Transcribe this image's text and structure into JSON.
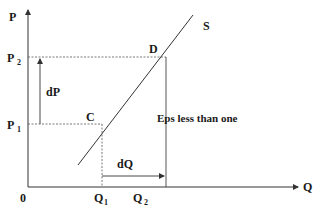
{
  "diagram": {
    "axes": {
      "y_label": "P",
      "x_label": "Q",
      "origin_label": "0"
    },
    "curve": {
      "label": "S"
    },
    "points": {
      "upper": {
        "label": "D"
      },
      "lower": {
        "label": "C"
      }
    },
    "price_levels": {
      "p1": {
        "main": "P",
        "sub": "1"
      },
      "p2": {
        "main": "P",
        "sub": "2"
      }
    },
    "quantity_levels": {
      "q1": {
        "main": "Q",
        "sub": "1"
      },
      "q2": {
        "main": "Q",
        "sub": "2"
      }
    },
    "changes": {
      "price_change": "dP",
      "quantity_change": "dQ"
    },
    "annotation": "Eps less than one",
    "colors": {
      "line": "#333333",
      "text": "#1a1a1a",
      "background": "#ffffff"
    }
  }
}
